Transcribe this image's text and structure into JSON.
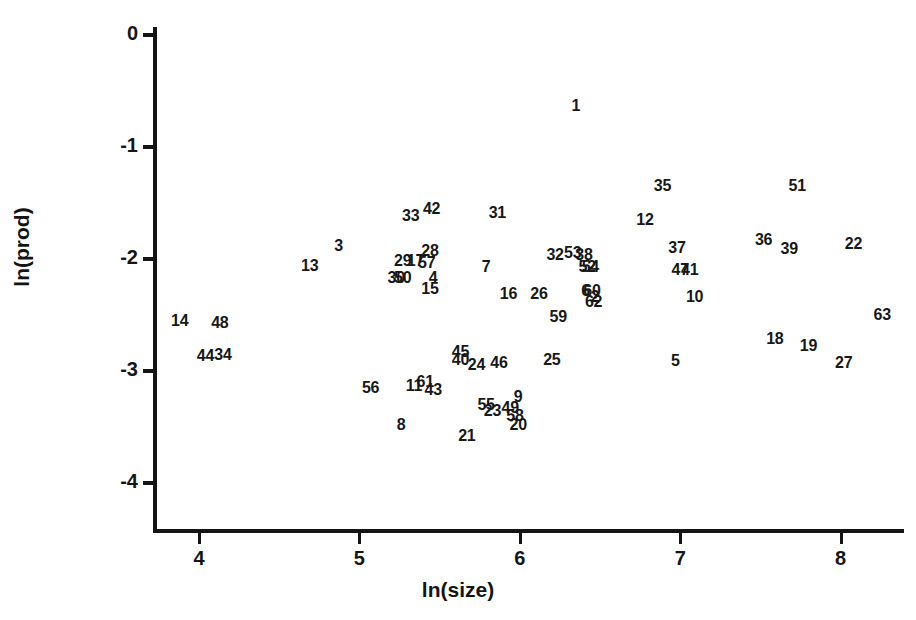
{
  "chart_data": {
    "type": "scatter",
    "title": "",
    "subtitle": "",
    "xlabel": "ln(size)",
    "ylabel": "ln(prod)",
    "xlim": [
      3.66,
      8.42
    ],
    "ylim": [
      -4.41,
      0.07
    ],
    "xticks": [
      4,
      5,
      6,
      7,
      8
    ],
    "xtick_labels": [
      "4",
      "5",
      "6",
      "7",
      "8"
    ],
    "yticks": [
      0,
      -1,
      -2,
      -3,
      -4
    ],
    "ytick_labels": [
      "0",
      "-1",
      "-2",
      "-3",
      "-4"
    ],
    "grid": false,
    "legend": null,
    "marker_style": "numeric-label",
    "note": "Each observation is rendered as its case number instead of a marker symbol.",
    "points": [
      {
        "label": "1",
        "x": 6.35,
        "y": -0.63
      },
      {
        "label": "2",
        "x": 6.47,
        "y": -2.34
      },
      {
        "label": "3",
        "x": 4.87,
        "y": -1.88
      },
      {
        "label": "4",
        "x": 5.46,
        "y": -2.17
      },
      {
        "label": "5",
        "x": 6.97,
        "y": -2.91
      },
      {
        "label": "6",
        "x": 6.41,
        "y": -2.29
      },
      {
        "label": "7",
        "x": 5.79,
        "y": -2.07
      },
      {
        "label": "8",
        "x": 5.26,
        "y": -3.48
      },
      {
        "label": "9",
        "x": 5.99,
        "y": -3.23
      },
      {
        "label": "10",
        "x": 7.09,
        "y": -2.34
      },
      {
        "label": "11",
        "x": 5.34,
        "y": -3.13
      },
      {
        "label": "12",
        "x": 6.78,
        "y": -1.65
      },
      {
        "label": "13",
        "x": 4.69,
        "y": -2.06
      },
      {
        "label": "14",
        "x": 3.88,
        "y": -2.55
      },
      {
        "label": "15",
        "x": 5.44,
        "y": -2.27
      },
      {
        "label": "16",
        "x": 5.93,
        "y": -2.31
      },
      {
        "label": "17",
        "x": 5.35,
        "y": -2.02
      },
      {
        "label": "18",
        "x": 7.59,
        "y": -2.71
      },
      {
        "label": "19",
        "x": 7.8,
        "y": -2.78
      },
      {
        "label": "20",
        "x": 5.99,
        "y": -3.48
      },
      {
        "label": "21",
        "x": 5.67,
        "y": -3.58
      },
      {
        "label": "22",
        "x": 8.08,
        "y": -1.87
      },
      {
        "label": "23",
        "x": 5.83,
        "y": -3.36
      },
      {
        "label": "24",
        "x": 5.73,
        "y": -2.95
      },
      {
        "label": "25",
        "x": 6.2,
        "y": -2.9
      },
      {
        "label": "26",
        "x": 6.12,
        "y": -2.31
      },
      {
        "label": "27",
        "x": 8.02,
        "y": -2.93
      },
      {
        "label": "28",
        "x": 5.44,
        "y": -1.93
      },
      {
        "label": "29",
        "x": 5.27,
        "y": -2.02
      },
      {
        "label": "30",
        "x": 5.23,
        "y": -2.17
      },
      {
        "label": "31",
        "x": 5.86,
        "y": -1.59
      },
      {
        "label": "32",
        "x": 6.22,
        "y": -1.96
      },
      {
        "label": "33",
        "x": 5.32,
        "y": -1.62
      },
      {
        "label": "34",
        "x": 4.15,
        "y": -2.86
      },
      {
        "label": "35",
        "x": 6.89,
        "y": -1.35
      },
      {
        "label": "36",
        "x": 7.52,
        "y": -1.83
      },
      {
        "label": "37",
        "x": 6.98,
        "y": -1.9
      },
      {
        "label": "38",
        "x": 6.4,
        "y": -1.96
      },
      {
        "label": "39",
        "x": 7.68,
        "y": -1.91
      },
      {
        "label": "40",
        "x": 5.63,
        "y": -2.9
      },
      {
        "label": "41",
        "x": 7.06,
        "y": -2.1
      },
      {
        "label": "42",
        "x": 5.45,
        "y": -1.55
      },
      {
        "label": "43",
        "x": 5.46,
        "y": -3.17
      },
      {
        "label": "44",
        "x": 4.04,
        "y": -2.87
      },
      {
        "label": "45",
        "x": 5.63,
        "y": -2.83
      },
      {
        "label": "46",
        "x": 5.87,
        "y": -2.93
      },
      {
        "label": "47",
        "x": 7.0,
        "y": -2.1
      },
      {
        "label": "48",
        "x": 4.13,
        "y": -2.57
      },
      {
        "label": "49",
        "x": 5.94,
        "y": -3.33
      },
      {
        "label": "50",
        "x": 5.27,
        "y": -2.17
      },
      {
        "label": "51",
        "x": 7.73,
        "y": -1.35
      },
      {
        "label": "52",
        "x": 6.42,
        "y": -2.07
      },
      {
        "label": "53",
        "x": 6.33,
        "y": -1.95
      },
      {
        "label": "54",
        "x": 6.44,
        "y": -2.07
      },
      {
        "label": "55",
        "x": 5.79,
        "y": -3.3
      },
      {
        "label": "56",
        "x": 5.07,
        "y": -3.15
      },
      {
        "label": "57",
        "x": 5.42,
        "y": -2.04
      },
      {
        "label": "58",
        "x": 5.97,
        "y": -3.4
      },
      {
        "label": "59",
        "x": 6.24,
        "y": -2.52
      },
      {
        "label": "60",
        "x": 6.45,
        "y": -2.29
      },
      {
        "label": "61",
        "x": 5.41,
        "y": -3.1
      },
      {
        "label": "62",
        "x": 6.46,
        "y": -2.38
      },
      {
        "label": "63",
        "x": 8.26,
        "y": -2.5
      }
    ]
  },
  "axes": {
    "x_title": "ln(size)",
    "y_title": "ln(prod)"
  }
}
